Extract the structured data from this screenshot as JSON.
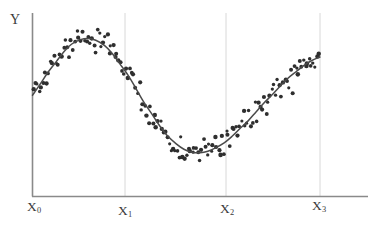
{
  "chart_data": {
    "type": "scatter",
    "title": "",
    "subtitle": "",
    "xlabel": "",
    "ylabel": "Y",
    "grid": true,
    "grid_axis": "x",
    "legend": false,
    "legend_position": "none",
    "axis_ranges": {
      "x": [
        0,
        3
      ],
      "y": [
        0,
        1
      ]
    },
    "x_tick_labels": [
      "X0",
      "X1",
      "X2",
      "X3"
    ],
    "x_tick_values": [
      0,
      1,
      2,
      3
    ],
    "y_tick_labels": [],
    "annotations": [],
    "series": [
      {
        "name": "fitted-curve",
        "type": "line",
        "color": "#4a4a4a",
        "x": [
          0.0,
          0.08,
          0.16,
          0.25,
          0.33,
          0.41,
          0.5,
          0.58,
          0.66,
          0.75,
          0.83,
          0.91,
          1.0,
          1.08,
          1.16,
          1.25,
          1.33,
          1.41,
          1.5,
          1.58,
          1.66,
          1.75,
          1.83,
          1.91,
          2.0,
          2.08,
          2.16,
          2.25,
          2.33,
          2.41,
          2.5,
          2.58,
          2.66,
          2.75,
          2.83,
          2.91,
          3.0
        ],
        "y": [
          0.553,
          0.625,
          0.7,
          0.772,
          0.835,
          0.884,
          0.912,
          0.92,
          0.908,
          0.875,
          0.824,
          0.757,
          0.68,
          0.596,
          0.51,
          0.428,
          0.353,
          0.29,
          0.24,
          0.205,
          0.186,
          0.182,
          0.192,
          0.214,
          0.246,
          0.287,
          0.335,
          0.388,
          0.444,
          0.5,
          0.556,
          0.61,
          0.66,
          0.705,
          0.744,
          0.776,
          0.8
        ]
      },
      {
        "name": "observations",
        "type": "scatter",
        "color": "#2e2e2e",
        "marker": "dot",
        "marker_size": 1.9,
        "n_points": 152,
        "noise_sd": 0.045
      }
    ]
  },
  "labels": {
    "y_axis": "Y",
    "x0": "X",
    "x0_sub": "0",
    "x1": "X",
    "x1_sub": "1",
    "x2": "X",
    "x2_sub": "2",
    "x3": "X",
    "x3_sub": "3"
  },
  "colors": {
    "axis": "#8a8a8a",
    "gridline": "#d8d8d8",
    "curve": "#4a4a4a",
    "point": "#2e2e2e",
    "text": "#3a3a3a",
    "background": "#ffffff"
  }
}
